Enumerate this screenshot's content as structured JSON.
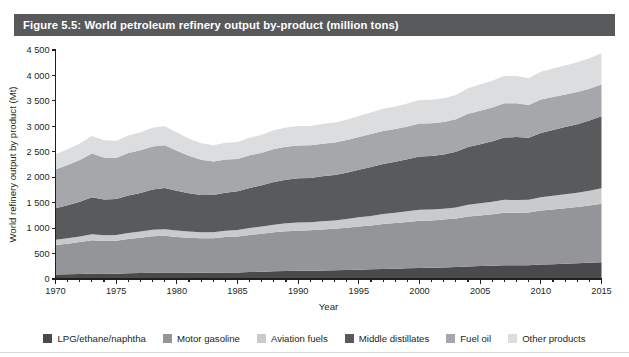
{
  "figure": {
    "title": "Figure 5.5: World petroleum refinery output by-product (million tons)",
    "title_bar_color": "#58595b"
  },
  "legend": {
    "items": [
      {
        "label": "LPG/ethane/naphtha",
        "color": "#4a4a4c",
        "icon": "square-swatch-icon"
      },
      {
        "label": "Motor gasoline",
        "color": "#949598",
        "icon": "square-swatch-icon"
      },
      {
        "label": "Aviation fuels",
        "color": "#c9cacb",
        "icon": "square-swatch-icon"
      },
      {
        "label": "Middle distillates",
        "color": "#595a5c",
        "icon": "square-swatch-icon"
      },
      {
        "label": "Fuel oil",
        "color": "#a6a7aa",
        "icon": "square-swatch-icon"
      },
      {
        "label": "Other products",
        "color": "#dcdddf",
        "icon": "square-swatch-icon"
      }
    ]
  },
  "axes": {
    "y_title": "World refinery output by product (Mt)",
    "x_title": "Year",
    "y_ticks": [
      "0",
      "500",
      "1 000",
      "1 500",
      "2 000",
      "2 500",
      "3 000",
      "3 500",
      "4 000",
      "4 500"
    ],
    "x_ticks": [
      "1970",
      "1975",
      "1980",
      "1985",
      "1990",
      "1995",
      "2000",
      "2005",
      "2010",
      "2015"
    ]
  },
  "chart_data": {
    "type": "area",
    "title": "Figure 5.5: World petroleum refinery output by-product (million tons)",
    "xlabel": "Year",
    "ylabel": "World refinery output by product (Mt)",
    "ylim": [
      0,
      4500
    ],
    "xlim": [
      1970,
      2015
    ],
    "ytick_step": 500,
    "xtick_step": 5,
    "minor_xtick_step": 1,
    "grid": false,
    "stacked": true,
    "legend_position": "bottom",
    "x": [
      1970,
      1971,
      1972,
      1973,
      1974,
      1975,
      1976,
      1977,
      1978,
      1979,
      1980,
      1981,
      1982,
      1983,
      1984,
      1985,
      1986,
      1987,
      1988,
      1989,
      1990,
      1991,
      1992,
      1993,
      1994,
      1995,
      1996,
      1997,
      1998,
      1999,
      2000,
      2001,
      2002,
      2003,
      2004,
      2005,
      2006,
      2007,
      2008,
      2009,
      2010,
      2011,
      2012,
      2013,
      2014,
      2015
    ],
    "series": [
      {
        "name": "LPG/ethane/naphtha",
        "color": "#4a4a4c",
        "values": [
          90,
          95,
          100,
          108,
          106,
          105,
          112,
          118,
          124,
          128,
          126,
          124,
          122,
          122,
          128,
          130,
          136,
          142,
          150,
          156,
          160,
          162,
          166,
          170,
          176,
          183,
          190,
          197,
          202,
          209,
          218,
          222,
          228,
          236,
          248,
          255,
          262,
          270,
          272,
          272,
          285,
          292,
          300,
          308,
          318,
          330
        ]
      },
      {
        "name": "Motor gasoline",
        "color": "#949598",
        "values": [
          580,
          600,
          625,
          655,
          640,
          648,
          672,
          692,
          715,
          720,
          700,
          688,
          678,
          680,
          695,
          705,
          730,
          748,
          768,
          782,
          790,
          795,
          805,
          815,
          830,
          848,
          862,
          882,
          898,
          912,
          925,
          930,
          940,
          955,
          980,
          995,
          1010,
          1030,
          1030,
          1035,
          1060,
          1075,
          1090,
          1105,
          1125,
          1150
        ]
      },
      {
        "name": "Aviation fuels",
        "color": "#c9cacb",
        "values": [
          100,
          105,
          110,
          118,
          112,
          112,
          118,
          122,
          128,
          130,
          126,
          120,
          118,
          118,
          124,
          128,
          134,
          142,
          150,
          156,
          160,
          158,
          162,
          165,
          172,
          180,
          188,
          196,
          202,
          210,
          218,
          212,
          212,
          216,
          230,
          238,
          245,
          255,
          252,
          248,
          260,
          268,
          275,
          282,
          292,
          305
        ]
      },
      {
        "name": "Middle distillates",
        "color": "#595a5c",
        "values": [
          620,
          650,
          685,
          725,
          702,
          705,
          740,
          760,
          790,
          810,
          780,
          755,
          735,
          730,
          750,
          762,
          790,
          812,
          840,
          858,
          868,
          872,
          885,
          895,
          912,
          935,
          960,
          985,
          1000,
          1020,
          1045,
          1055,
          1068,
          1092,
          1135,
          1160,
          1190,
          1225,
          1235,
          1220,
          1265,
          1295,
          1320,
          1348,
          1378,
          1415
        ]
      },
      {
        "name": "Fuel oil",
        "color": "#a6a7aa",
        "values": [
          760,
          790,
          820,
          860,
          830,
          810,
          835,
          840,
          845,
          840,
          790,
          735,
          690,
          660,
          650,
          635,
          640,
          638,
          645,
          648,
          645,
          640,
          640,
          638,
          640,
          645,
          648,
          650,
          648,
          645,
          648,
          640,
          638,
          640,
          655,
          660,
          665,
          672,
          665,
          645,
          655,
          645,
          640,
          632,
          625,
          620
        ]
      },
      {
        "name": "Other products",
        "color": "#dcdddf",
        "values": [
          300,
          312,
          325,
          345,
          335,
          330,
          345,
          352,
          368,
          375,
          355,
          340,
          325,
          318,
          328,
          332,
          345,
          355,
          368,
          378,
          382,
          380,
          388,
          392,
          400,
          412,
          422,
          435,
          442,
          452,
          465,
          462,
          468,
          478,
          498,
          512,
          525,
          540,
          536,
          525,
          548,
          560,
          572,
          585,
          600,
          615
        ]
      }
    ],
    "totals": [
      2450,
      2552,
      2665,
      2811,
      2725,
      2710,
      2822,
      2884,
      2970,
      3003,
      2877,
      2762,
      2666,
      2628,
      2675,
      2692,
      2775,
      2837,
      2921,
      2978,
      3005,
      3007,
      3046,
      3075,
      3130,
      3203,
      3270,
      3345,
      3392,
      3448,
      3519,
      3521,
      3554,
      3617,
      3746,
      3820,
      3897,
      3992,
      3990,
      3945,
      4073,
      4135,
      4197,
      4260,
      4338,
      4435
    ]
  }
}
